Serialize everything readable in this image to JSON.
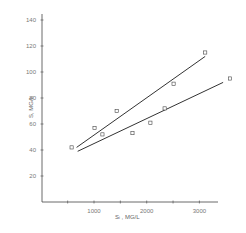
{
  "chart_data": {
    "type": "scatter",
    "title": "",
    "xlabel": "Sᵢ , MG/L",
    "ylabel": "S , MG/L",
    "xlim": [
      0,
      3700
    ],
    "ylim": [
      0,
      140
    ],
    "x_ticks": [
      1000,
      2000,
      3000
    ],
    "x_minor_ticks": [
      500,
      1000,
      1500,
      2000,
      2500,
      3000
    ],
    "y_ticks": [
      20,
      40,
      60,
      80,
      100,
      120,
      140
    ],
    "grid": false,
    "legend": null,
    "series": [
      {
        "name": "observations",
        "marker": "open-square",
        "points": [
          {
            "x": 575,
            "y": 42
          },
          {
            "x": 1010,
            "y": 57
          },
          {
            "x": 1160,
            "y": 52
          },
          {
            "x": 1430,
            "y": 70
          },
          {
            "x": 1730,
            "y": 53
          },
          {
            "x": 2070,
            "y": 61
          },
          {
            "x": 2340,
            "y": 72
          },
          {
            "x": 2510,
            "y": 91
          },
          {
            "x": 3110,
            "y": 115
          },
          {
            "x": 3580,
            "y": 95
          }
        ]
      },
      {
        "name": "upper-fit-line",
        "type": "line",
        "points": [
          {
            "x": 670,
            "y": 42
          },
          {
            "x": 3110,
            "y": 112
          }
        ]
      },
      {
        "name": "lower-fit-line",
        "type": "line",
        "points": [
          {
            "x": 690,
            "y": 39
          },
          {
            "x": 3450,
            "y": 92
          }
        ]
      }
    ]
  },
  "axes": {
    "x_tick_labels": [
      "1000",
      "2000",
      "3000"
    ],
    "y_tick_labels": [
      "20",
      "40",
      "60",
      "80",
      "100",
      "120",
      "140"
    ],
    "x_title": "Sᵢ ,  MG/L",
    "y_title": "S,  MG/L"
  },
  "colors": {
    "ink": "#444444",
    "line": "#333333",
    "background": "#ffffff"
  }
}
